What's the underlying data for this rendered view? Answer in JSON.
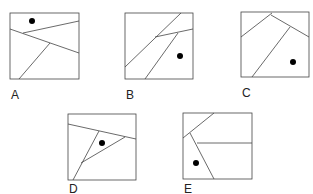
{
  "figures": [
    {
      "label": "A",
      "has_dot": true,
      "regions": 4
    },
    {
      "label": "B",
      "has_dot": true,
      "regions": 4
    },
    {
      "label": "C",
      "has_dot": true,
      "regions": 4
    },
    {
      "label": "D",
      "has_dot": true,
      "regions": 4
    },
    {
      "label": "E",
      "has_dot": true,
      "regions": 4
    }
  ],
  "colors": {
    "stroke": "#444444",
    "dot": "#000000",
    "text": "#222222"
  }
}
